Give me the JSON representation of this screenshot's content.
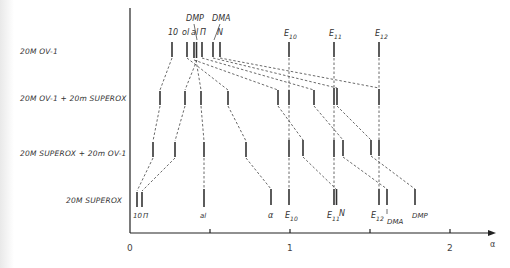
{
  "rows": [
    {
      "label": "20M  OV-1",
      "y_top": 42,
      "y_bot": 62,
      "label_x": 20,
      "label_y": 54
    },
    {
      "label": "20M  OV-1 + 20m SUPEROX",
      "y_top": 88,
      "y_bot": 108,
      "label_x": 20,
      "label_y": 101
    },
    {
      "label": "20M SUPEROX + 20m OV-1",
      "y_top": 142,
      "y_bot": 162,
      "label_x": 20,
      "label_y": 156
    },
    {
      "label": "20M  SUPEROX",
      "y_top": 188,
      "y_bot": 208,
      "label_x": 66,
      "label_y": 203
    }
  ],
  "axis": {
    "x_label": "α",
    "ticks": [
      {
        "value": 0,
        "label": "0",
        "x": 130
      },
      {
        "value": 0.5,
        "label": "",
        "x": 210
      },
      {
        "value": 1,
        "label": "1",
        "x": 290
      },
      {
        "value": 1.5,
        "label": "",
        "x": 370
      },
      {
        "value": 2,
        "label": "2",
        "x": 450
      }
    ]
  },
  "peaks": {
    "row1": [
      172,
      187,
      194,
      196,
      202,
      213,
      220,
      289,
      334,
      379
    ],
    "row2": [
      160,
      185,
      201,
      228,
      278,
      289,
      314,
      334,
      337,
      379
    ],
    "row3": [
      153,
      175,
      204,
      246,
      289,
      303,
      334,
      343,
      371,
      379
    ],
    "row4": [
      137,
      142,
      204,
      271,
      289,
      334,
      336,
      379,
      387,
      415
    ]
  },
  "top_labels": [
    {
      "text": "10",
      "x": 168,
      "y": 34
    },
    {
      "text": "ol",
      "x": 183,
      "y": 34
    },
    {
      "text": "al",
      "x": 192,
      "y": 34
    },
    {
      "text": "Π",
      "x": 200,
      "y": 34
    },
    {
      "text": "N",
      "x": 217,
      "y": 34
    },
    {
      "text": "DMP",
      "x": 186,
      "y": 20
    },
    {
      "text": "DMA",
      "x": 212,
      "y": 20
    },
    {
      "text": "E",
      "sub": "10",
      "x": 285,
      "y": 37
    },
    {
      "text": "E",
      "sub": "11",
      "x": 330,
      "y": 37
    },
    {
      "text": "E",
      "sub": "12",
      "x": 376,
      "y": 37
    }
  ],
  "bottom_labels": [
    {
      "text": "10",
      "x": 134,
      "y": 219
    },
    {
      "text": "Π",
      "x": 143,
      "y": 219
    },
    {
      "text": "al",
      "x": 201,
      "y": 219
    },
    {
      "text": "α",
      "x": 268,
      "y": 219
    },
    {
      "text": "E",
      "sub": "10",
      "x": 286,
      "y": 219
    },
    {
      "text": "E",
      "sub": "11",
      "x": 327,
      "y": 219
    },
    {
      "text": "N",
      "x": 338,
      "y": 218
    },
    {
      "text": "E",
      "sub": "12",
      "x": 372,
      "y": 219
    },
    {
      "text": "DMA",
      "x": 387,
      "y": 225
    },
    {
      "text": "DMP",
      "x": 412,
      "y": 219
    }
  ]
}
